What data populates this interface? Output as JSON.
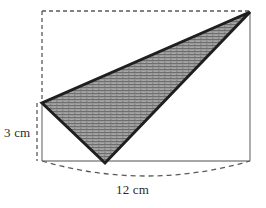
{
  "figure": {
    "type": "geometry-diagram",
    "canvas": {
      "width": 266,
      "height": 208,
      "background": "#ffffff"
    },
    "labels": {
      "height": "3 cm",
      "base": "12 cm"
    },
    "colors": {
      "outline": "#1f1f1f",
      "fill": "#9a9a9a",
      "hatch": "#6f6f6f",
      "dashed": "#5a5a5a",
      "solid_guide": "#8a8a8a",
      "text": "#2b2b2b"
    },
    "shapes": {
      "triangle": {
        "name": "shaded-triangle",
        "points": "42,103 105,163 250,12",
        "vertices": [
          {
            "name": "left-vertex",
            "x": 42,
            "y": 103
          },
          {
            "name": "bottom-vertex",
            "x": 105,
            "y": 163
          },
          {
            "name": "top-right-vertex",
            "x": 250,
            "y": 12
          }
        ],
        "stroke_width": 3,
        "fill_pattern": "horizontal-hatch"
      },
      "bounding_box": {
        "name": "dashed-bounding-rectangle",
        "left": 42,
        "top": 11,
        "right": 250,
        "bottom": 161,
        "top_edge_style": "dashed",
        "left_edge_style": "dashed",
        "right_edge_style": "solid",
        "bottom_edge_style": "solid"
      },
      "height_guide": {
        "name": "height-dashed-guide",
        "x": 42,
        "y1": 103,
        "y2": 163,
        "style": "dashed"
      },
      "base_arc": {
        "name": "base-dashed-arc",
        "start": {
          "x": 42,
          "y": 161
        },
        "end": {
          "x": 250,
          "y": 161
        },
        "control": {
          "x": 146,
          "y": 191
        },
        "style": "dashed"
      }
    },
    "measurements": {
      "height_cm": 3,
      "base_cm": 12
    }
  }
}
